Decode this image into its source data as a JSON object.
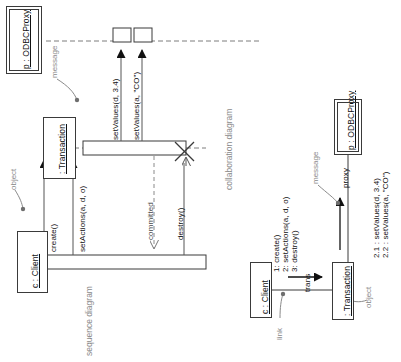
{
  "figure": {
    "captions": {
      "sequence": "sequence diagram",
      "collaboration": "collaboration diagram"
    },
    "colors": {
      "stroke": "#3a3a3a",
      "annotation": "#8a8a8a",
      "text": "#111111",
      "background": "#ffffff"
    }
  },
  "sequence_diagram": {
    "lifelines": [
      {
        "name": "proxy-lifeline",
        "label": "p : ODBCProxy",
        "style": "double-frame"
      },
      {
        "name": "transaction-lifeline",
        "label": ": Transaction",
        "style": "single-frame"
      },
      {
        "name": "client-lifeline",
        "label": "c : Client",
        "style": "single-frame"
      }
    ],
    "messages": [
      {
        "id": "m1",
        "label": "create()",
        "kind": "solid-filled-arrow"
      },
      {
        "id": "m2",
        "label": "setActions(a, d, o)",
        "kind": "solid-filled-arrow"
      },
      {
        "id": "m3",
        "label": "setValues(d, 3.4)",
        "kind": "solid-filled-arrow"
      },
      {
        "id": "m4",
        "label": "setValues(a, \"CO\")",
        "kind": "solid-filled-arrow"
      },
      {
        "id": "m5",
        "label": "committed",
        "kind": "dashed-return"
      },
      {
        "id": "m6",
        "label": "destroy()",
        "kind": "solid-open-arrow"
      }
    ],
    "annotations": [
      {
        "name": "message-annotation",
        "label": "message"
      },
      {
        "name": "object-annotation",
        "label": "object"
      }
    ],
    "destruction_marker": "X"
  },
  "collaboration_diagram": {
    "objects": [
      {
        "name": "client-object",
        "label": "c : Client",
        "style": "single-frame"
      },
      {
        "name": "transaction-object",
        "label": ": Transaction",
        "style": "single-frame"
      },
      {
        "name": "proxy-object",
        "label": "p : ODBCProxy",
        "style": "double-frame"
      }
    ],
    "links": [
      {
        "name": "client-trans-link",
        "role": "trans"
      },
      {
        "name": "trans-proxy-link",
        "role": "proxy"
      }
    ],
    "messages_client_to_trans": [
      "1: create()",
      "2: setActions(a, d, o)",
      "3: destroy()"
    ],
    "messages_trans_to_proxy": [
      "2.1 : setValues(d, 3.4)",
      "2.2 : setValues(a, \"CO\")"
    ],
    "annotations": [
      {
        "name": "link-annotation",
        "label": "link"
      },
      {
        "name": "object-annotation",
        "label": "object"
      },
      {
        "name": "message-annotation",
        "label": "message"
      }
    ]
  }
}
